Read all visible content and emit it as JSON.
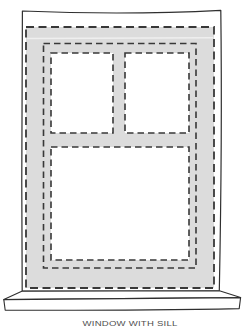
{
  "diagram": {
    "caption": "WINDOW WITH SILL"
  },
  "colors": {
    "background": "#ffffff",
    "frame_fill": "#dcdcdc",
    "pane_fill": "#ffffff",
    "outline": "#2f2f2f",
    "dash": "#383838",
    "caption_text": "#4f4f4f"
  }
}
